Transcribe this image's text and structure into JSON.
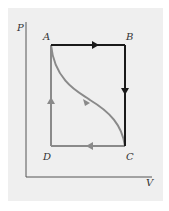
{
  "diagram": {
    "type": "PV cycle diagram",
    "axes": {
      "y_label": "P",
      "x_label": "V"
    },
    "points": [
      {
        "id": "A",
        "label": "A"
      },
      {
        "id": "B",
        "label": "B"
      },
      {
        "id": "C",
        "label": "C"
      },
      {
        "id": "D",
        "label": "D"
      }
    ],
    "paths": [
      {
        "from": "A",
        "to": "B",
        "style": "dark",
        "direction": "right"
      },
      {
        "from": "B",
        "to": "C",
        "style": "dark",
        "direction": "down"
      },
      {
        "from": "C",
        "to": "D",
        "style": "gray",
        "direction": "left"
      },
      {
        "from": "D",
        "to": "A",
        "style": "gray",
        "direction": "up"
      },
      {
        "from": "A",
        "to": "C",
        "style": "gray-curve",
        "direction": "down-right"
      }
    ],
    "colors": {
      "dark": "#1a1a1a",
      "gray": "#8a8a8a",
      "axis": "#555555",
      "background": "#efefef"
    }
  }
}
